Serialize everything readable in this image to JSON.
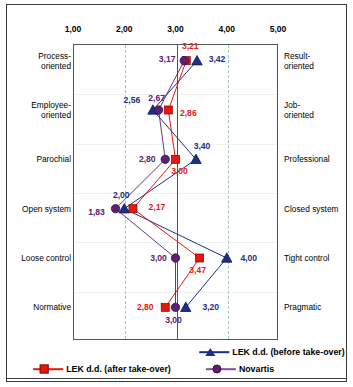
{
  "chart_data": {
    "type": "line",
    "orientation": "horizontal-opposed-scale",
    "title": "",
    "subtitle": "",
    "xlabel": "",
    "ylabel": "",
    "xlim": [
      1,
      5
    ],
    "xticks": [
      "1,00",
      "2,00",
      "3,00",
      "4,00",
      "5,00"
    ],
    "xtick_values": [
      1,
      2,
      3,
      4,
      5
    ],
    "grid": true,
    "gridlines": [
      2,
      3,
      4
    ],
    "legend_position": "bottom",
    "categories_left": [
      "Process-\noriented",
      "Employee-\noriented",
      "Parochial",
      "Open system",
      "Loose control",
      "Normative"
    ],
    "categories_right": [
      "Result-\noriented",
      "Job-\noriented",
      "Professional",
      "Closed system",
      "Tight control",
      "Pragmatic"
    ],
    "series": [
      {
        "name": "LEK d.d. (before take-over)",
        "color": "#1b2f86",
        "marker": "triangle",
        "values": [
          3.42,
          2.56,
          3.4,
          2.0,
          4.0,
          3.2
        ],
        "labels": [
          "3,42",
          "2,56",
          "3,40",
          "2,00",
          "4,00",
          "3,20"
        ]
      },
      {
        "name": "LEK d.d. (after take-over)",
        "color": "#e8180f",
        "marker": "square",
        "values": [
          3.21,
          2.86,
          3.0,
          2.17,
          3.47,
          2.8
        ],
        "labels": [
          "3,21",
          "2,86",
          "3,00",
          "2,17",
          "3,47",
          "2,80"
        ]
      },
      {
        "name": "Novartis",
        "color": "#5b2070",
        "marker": "circle",
        "values": [
          3.17,
          2.67,
          2.8,
          1.83,
          3.0,
          3.0
        ],
        "labels": [
          "3,17",
          "2,67",
          "2,80",
          "1,83",
          "3,00",
          "3,00"
        ]
      }
    ]
  },
  "axis": {
    "ticks": [
      {
        "label": "1,00"
      },
      {
        "label": "2,00"
      },
      {
        "label": "3,00"
      },
      {
        "label": "4,00"
      },
      {
        "label": "5,00"
      }
    ]
  },
  "rows": [
    {
      "left": "Process-",
      "left2": "oriented",
      "right": "Result-",
      "right2": "oriented"
    },
    {
      "left": "Employee-",
      "left2": "oriented",
      "right": "Job-",
      "right2": "oriented"
    },
    {
      "left": "Parochial",
      "left2": "",
      "right": "Professional",
      "right2": ""
    },
    {
      "left": "Open system",
      "left2": "",
      "right": "Closed system",
      "right2": ""
    },
    {
      "left": "Loose control",
      "left2": "",
      "right": "Tight control",
      "right2": ""
    },
    {
      "left": "Normative",
      "left2": "",
      "right": "Pragmatic",
      "right2": ""
    }
  ],
  "legend": {
    "before": "LEK d.d. (before take-over)",
    "after": "LEK d.d. (after take-over)",
    "novartis": "Novartis"
  },
  "colors": {
    "blue": "#1b2f86",
    "red": "#e8180f",
    "purple": "#5b2070",
    "grid": "#9fc5c5",
    "frame": "#3a3a3a"
  }
}
